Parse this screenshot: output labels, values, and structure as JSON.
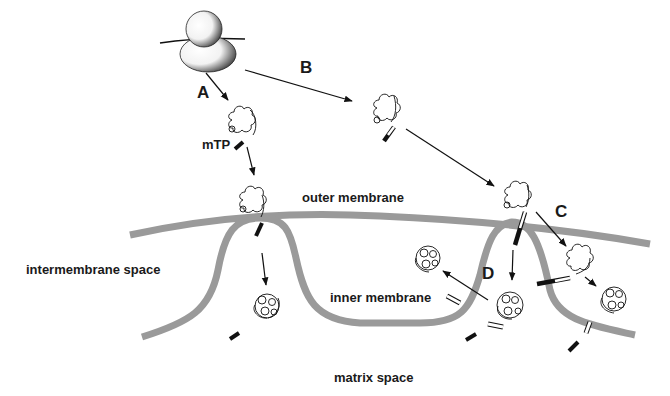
{
  "diagram": {
    "colors": {
      "membrane": "#9a9a9a",
      "ink": "#111111",
      "background": "#ffffff"
    },
    "regions": {
      "outer_membrane": "outer membrane",
      "inner_membrane": "inner membrane",
      "intermembrane_space": "intermembrane space",
      "matrix_space": "matrix space"
    },
    "pathways": {
      "a": "A",
      "b": "B",
      "c": "C",
      "d": "D"
    },
    "signal_label": "mTP",
    "elements": [
      "ribosome",
      "nascent-protein-with-mTP",
      "import-channel",
      "cleaved-presequence",
      "folded-mature-protein"
    ]
  }
}
